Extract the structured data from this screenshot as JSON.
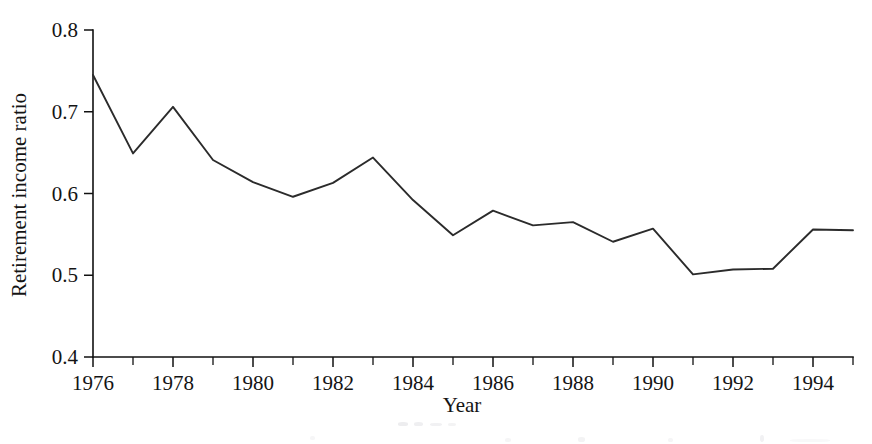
{
  "figure": {
    "name": "retirement-income-ratio-line-chart",
    "background_color": "#ffffff",
    "line_color": "#2b2b2b",
    "axis_color": "#111111"
  },
  "chart_data": {
    "type": "line",
    "title": "",
    "xlabel": "Year",
    "ylabel": "Retirement income ratio",
    "xlim": [
      1976,
      1995
    ],
    "ylim": [
      0.4,
      0.8
    ],
    "grid": false,
    "legend": "none",
    "x_tick_labels": [
      "1976",
      "1978",
      "1980",
      "1982",
      "1984",
      "1986",
      "1988",
      "1990",
      "1992",
      "1994"
    ],
    "x_tick_values": [
      1976,
      1978,
      1980,
      1982,
      1984,
      1986,
      1988,
      1990,
      1992,
      1994
    ],
    "x_minor_tick_values": [
      1977,
      1979,
      1981,
      1983,
      1985,
      1987,
      1989,
      1991,
      1993,
      1995
    ],
    "y_tick_labels": [
      "0.4",
      "0.5",
      "0.6",
      "0.7",
      "0.8"
    ],
    "y_tick_values": [
      0.4,
      0.5,
      0.6,
      0.7,
      0.8
    ],
    "x": [
      1976,
      1977,
      1978,
      1979,
      1980,
      1981,
      1982,
      1983,
      1984,
      1985,
      1986,
      1987,
      1988,
      1989,
      1990,
      1991,
      1992,
      1993,
      1994,
      1995
    ],
    "values": [
      0.745,
      0.649,
      0.706,
      0.641,
      0.614,
      0.596,
      0.613,
      0.644,
      0.592,
      0.549,
      0.579,
      0.561,
      0.565,
      0.541,
      0.557,
      0.501,
      0.507,
      0.508,
      0.556,
      0.555
    ],
    "series": [
      {
        "name": "Retirement income ratio",
        "values": [
          0.745,
          0.649,
          0.706,
          0.641,
          0.614,
          0.596,
          0.613,
          0.644,
          0.592,
          0.549,
          0.579,
          0.561,
          0.565,
          0.541,
          0.557,
          0.501,
          0.507,
          0.508,
          0.556,
          0.555
        ]
      }
    ]
  }
}
